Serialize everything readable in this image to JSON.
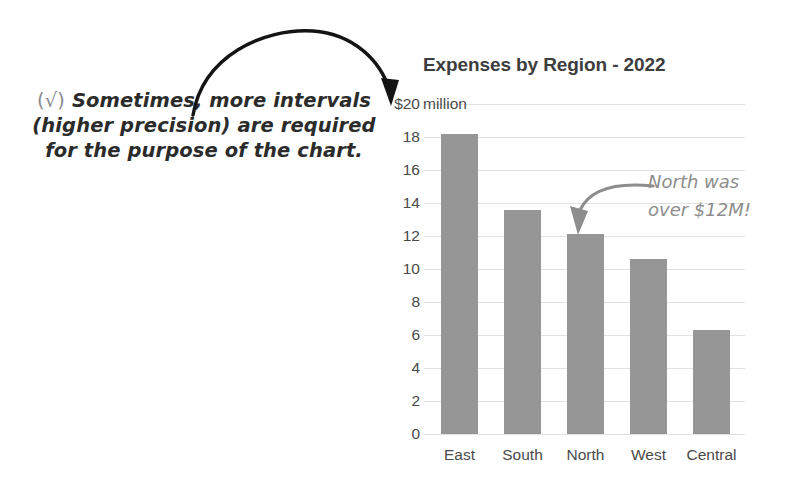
{
  "chart_data": {
    "type": "bar",
    "title": "Expenses by Region - 2022",
    "categories": [
      "East",
      "South",
      "North",
      "West",
      "Central"
    ],
    "values": [
      18.2,
      13.6,
      12.1,
      10.6,
      6.3
    ],
    "xlabel": "",
    "ylabel": "$20 million",
    "ylim": [
      0,
      20
    ],
    "ytick_values": [
      20,
      18,
      16,
      14,
      12,
      10,
      8,
      6,
      4,
      2,
      0
    ],
    "ytick_labels": [
      "$20",
      "18",
      "16",
      "14",
      "12",
      "10",
      "8",
      "6",
      "4",
      "2",
      "0"
    ],
    "y_unit_word": "million",
    "grid": true,
    "legend": "none",
    "bar_color": "#969696",
    "annotations": [
      "North was over $12M!",
      "(√) Sometimes, more intervals (higher precision) are required for the purpose of the chart."
    ]
  },
  "note": {
    "check": "(√)",
    "line1": "Sometimes, more intervals",
    "line2": "(higher precision) are required",
    "line3": "for the purpose of the chart.",
    "color": "#2b2b2b"
  },
  "callout": {
    "line1": "North was",
    "line2": "over $12M!",
    "color": "#8d8d8d"
  },
  "arrows": {
    "black_arrow_target": "$20 million axis label",
    "gray_arrow_target": "North bar"
  }
}
